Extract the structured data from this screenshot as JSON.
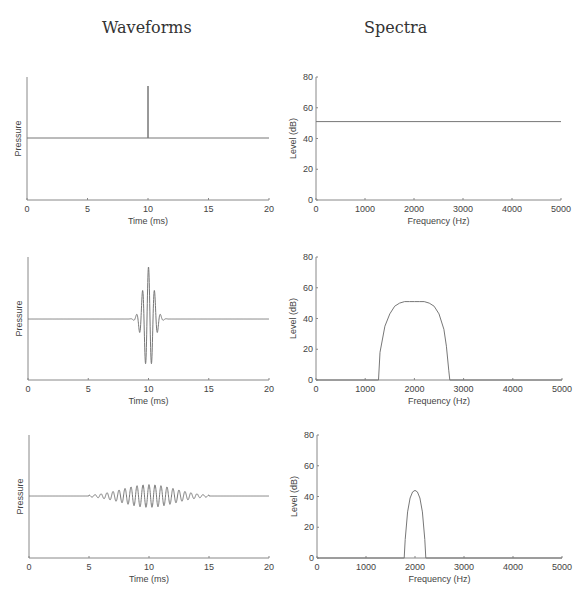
{
  "headers": {
    "waveforms": "Waveforms",
    "spectra": "Spectra"
  },
  "colors": {
    "trace": "#777777",
    "axis": "#888888",
    "text": "#444444"
  },
  "chart_data": [
    {
      "id": "waveform-1",
      "type": "line",
      "title": "",
      "xlabel": "Time (ms)",
      "ylabel": "Pressure",
      "xlim": [
        0,
        20
      ],
      "xticks": [
        0,
        5,
        10,
        15,
        20
      ],
      "yticks": [],
      "description": "Single click/impulse at 10 ms",
      "signal": {
        "kind": "impulse",
        "t0": 10,
        "amplitude": 1.0
      },
      "box": {
        "x0": 27,
        "x1": 269,
        "ytop": 77,
        "ybottom": 200,
        "baseline": 138,
        "amp_px": 52
      }
    },
    {
      "id": "spectrum-1",
      "type": "line",
      "title": "",
      "xlabel": "Frequency (Hz)",
      "ylabel": "Level (dB)",
      "xlim": [
        0,
        5000
      ],
      "ylim": [
        0,
        80
      ],
      "xticks": [
        0,
        1000,
        2000,
        3000,
        4000,
        5000
      ],
      "yticks": [
        0,
        20,
        40,
        60,
        80
      ],
      "x": [
        0,
        5000
      ],
      "y": [
        51,
        51
      ],
      "description": "Flat spectrum at ~51 dB",
      "box": {
        "x0": 316,
        "x1": 561,
        "ytop": 77,
        "ybottom": 200
      }
    },
    {
      "id": "waveform-2",
      "type": "line",
      "title": "",
      "xlabel": "Time (ms)",
      "ylabel": "Pressure",
      "xlim": [
        0,
        20
      ],
      "xticks": [
        0,
        5,
        10,
        15,
        20
      ],
      "yticks": [],
      "description": "Short tone burst centered at 10 ms, ~2 kHz carrier, spans ~8-12 ms",
      "signal": {
        "kind": "burst",
        "t0": 10,
        "freq_khz": 2.0,
        "sigma_ms": 0.45,
        "amplitude": 1.0,
        "span": [
          7.8,
          12.2
        ]
      },
      "box": {
        "x0": 28,
        "x1": 269,
        "ytop": 257,
        "ybottom": 380,
        "baseline": 319,
        "amp_px": 52
      }
    },
    {
      "id": "spectrum-2",
      "type": "line",
      "title": "",
      "xlabel": "Frequency (Hz)",
      "ylabel": "Level (dB)",
      "xlim": [
        0,
        5000
      ],
      "ylim": [
        0,
        80
      ],
      "xticks": [
        0,
        1000,
        2000,
        3000,
        4000,
        5000
      ],
      "yticks": [
        0,
        20,
        40,
        60,
        80
      ],
      "x": [
        0,
        1270,
        1300,
        1400,
        1500,
        1600,
        1700,
        1800,
        1900,
        2000,
        2100,
        2200,
        2300,
        2400,
        2500,
        2600,
        2650,
        2700,
        2720,
        5000
      ],
      "y": [
        0,
        0,
        18,
        35,
        43,
        48,
        50,
        51,
        51,
        51,
        51,
        51,
        50,
        48,
        43,
        33,
        22,
        6,
        0,
        0
      ],
      "description": "Broad band spectrum ~1270-2720 Hz, peak ~51 dB",
      "box": {
        "x0": 316,
        "x1": 562,
        "ytop": 257,
        "ybottom": 380
      }
    },
    {
      "id": "waveform-3",
      "type": "line",
      "title": "",
      "xlabel": "Time (ms)",
      "ylabel": "Pressure",
      "xlim": [
        0,
        20
      ],
      "xticks": [
        0,
        5,
        10,
        15,
        20
      ],
      "yticks": [],
      "description": "Long low-amplitude tone burst, ~2 kHz carrier, spans ~5-15 ms",
      "signal": {
        "kind": "burst",
        "t0": 10,
        "freq_khz": 2.0,
        "sigma_ms": 2.2,
        "amplitude": 0.22,
        "span": [
          5,
          15
        ]
      },
      "box": {
        "x0": 29,
        "x1": 269,
        "ytop": 435,
        "ybottom": 558,
        "baseline": 496,
        "amp_px": 52
      }
    },
    {
      "id": "spectrum-3",
      "type": "line",
      "title": "",
      "xlabel": "Frequency (Hz)",
      "ylabel": "Level (dB)",
      "xlim": [
        0,
        5000
      ],
      "ylim": [
        0,
        80
      ],
      "xticks": [
        0,
        1000,
        2000,
        3000,
        4000,
        5000
      ],
      "yticks": [
        0,
        20,
        40,
        60,
        80
      ],
      "x": [
        0,
        1780,
        1800,
        1850,
        1900,
        1950,
        2000,
        2050,
        2100,
        2150,
        2200,
        2220,
        5000
      ],
      "y": [
        0,
        0,
        12,
        30,
        39,
        43,
        44,
        43,
        39,
        30,
        12,
        0,
        0
      ],
      "description": "Narrow spectrum ~1780-2220 Hz, peak ~44 dB at 2000 Hz",
      "box": {
        "x0": 317,
        "x1": 562,
        "ytop": 435,
        "ybottom": 558
      }
    }
  ]
}
